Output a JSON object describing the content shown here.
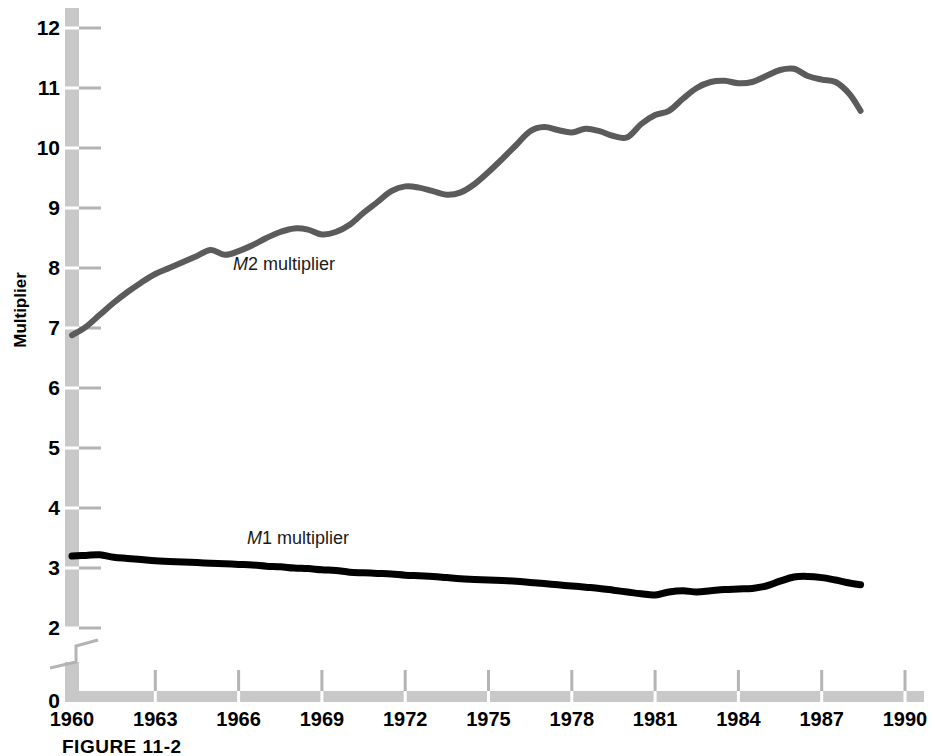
{
  "figure": {
    "caption": "FIGURE 11-2"
  },
  "chart_data": {
    "type": "line",
    "title": "",
    "xlabel": "",
    "ylabel": "Multiplier",
    "xlim": [
      1960,
      1990
    ],
    "ylim": [
      2,
      12.4
    ],
    "y_axis_break_below": 2,
    "y_zero_label": "0",
    "grid": false,
    "legend_position": "inline-annotation",
    "yticks": [
      2,
      3,
      4,
      5,
      6,
      7,
      8,
      9,
      10,
      11,
      12
    ],
    "ytick_labels": [
      "2",
      "3",
      "4",
      "5",
      "6",
      "7",
      "8",
      "9",
      "10",
      "11",
      "12"
    ],
    "xticks": [
      1960,
      1963,
      1966,
      1969,
      1972,
      1975,
      1978,
      1981,
      1984,
      1987,
      1990
    ],
    "xtick_labels": [
      "1960",
      "1963",
      "1966",
      "1969",
      "1972",
      "1975",
      "1978",
      "1981",
      "1984",
      "1987",
      "1990"
    ],
    "colors": {
      "m2_line": "#5b5b5b",
      "m1_line": "#000000",
      "axis_bar": "#c8c8c8",
      "tick_mark": "#b4b4b4"
    },
    "series": [
      {
        "name": "M2 multiplier",
        "label_html": "M2 multiplier",
        "color": "#5b5b5b",
        "width": 6,
        "x": [
          1960.0,
          1960.5,
          1961.0,
          1961.5,
          1962.0,
          1962.5,
          1963.0,
          1963.5,
          1964.0,
          1964.5,
          1965.0,
          1965.5,
          1966.0,
          1966.5,
          1967.0,
          1967.5,
          1968.0,
          1968.5,
          1969.0,
          1969.5,
          1970.0,
          1970.5,
          1971.0,
          1971.5,
          1972.0,
          1972.5,
          1973.0,
          1973.5,
          1974.0,
          1974.5,
          1975.0,
          1975.5,
          1976.0,
          1976.5,
          1977.0,
          1977.5,
          1978.0,
          1978.5,
          1979.0,
          1979.5,
          1980.0,
          1980.5,
          1981.0,
          1981.5,
          1982.0,
          1982.5,
          1983.0,
          1983.5,
          1984.0,
          1984.5,
          1985.0,
          1985.5,
          1986.0,
          1986.5,
          1987.0,
          1987.5,
          1988.0,
          1988.4
        ],
        "values": [
          6.88,
          7.02,
          7.22,
          7.42,
          7.6,
          7.76,
          7.9,
          8.0,
          8.1,
          8.2,
          8.3,
          8.22,
          8.28,
          8.38,
          8.5,
          8.6,
          8.66,
          8.64,
          8.56,
          8.6,
          8.72,
          8.92,
          9.1,
          9.28,
          9.36,
          9.34,
          9.28,
          9.22,
          9.26,
          9.4,
          9.6,
          9.82,
          10.05,
          10.28,
          10.35,
          10.3,
          10.26,
          10.32,
          10.28,
          10.2,
          10.18,
          10.4,
          10.55,
          10.62,
          10.82,
          11.0,
          11.1,
          11.12,
          11.08,
          11.1,
          11.2,
          11.3,
          11.32,
          11.2,
          11.14,
          11.1,
          10.9,
          10.62
        ],
        "start_value": 6.88,
        "peak_value": 11.32,
        "peak_year": 1986,
        "end_value": 10.62
      },
      {
        "name": "M1 multiplier",
        "label_html": "M1 multiplier",
        "color": "#000000",
        "width": 7,
        "x": [
          1960.0,
          1960.5,
          1961.0,
          1961.5,
          1962.0,
          1962.5,
          1963.0,
          1963.5,
          1964.0,
          1964.5,
          1965.0,
          1965.5,
          1966.0,
          1966.5,
          1967.0,
          1967.5,
          1968.0,
          1968.5,
          1969.0,
          1969.5,
          1970.0,
          1970.5,
          1971.0,
          1971.5,
          1972.0,
          1972.5,
          1973.0,
          1973.5,
          1974.0,
          1974.5,
          1975.0,
          1975.5,
          1976.0,
          1976.5,
          1977.0,
          1977.5,
          1978.0,
          1978.5,
          1979.0,
          1979.5,
          1980.0,
          1980.5,
          1981.0,
          1981.5,
          1982.0,
          1982.5,
          1983.0,
          1983.5,
          1984.0,
          1984.5,
          1985.0,
          1985.5,
          1986.0,
          1986.5,
          1987.0,
          1987.5,
          1988.0,
          1988.4
        ],
        "values": [
          3.2,
          3.21,
          3.22,
          3.18,
          3.16,
          3.14,
          3.12,
          3.11,
          3.1,
          3.09,
          3.08,
          3.07,
          3.06,
          3.05,
          3.03,
          3.02,
          3.0,
          2.99,
          2.97,
          2.96,
          2.93,
          2.92,
          2.91,
          2.9,
          2.88,
          2.87,
          2.86,
          2.84,
          2.82,
          2.81,
          2.8,
          2.79,
          2.78,
          2.76,
          2.74,
          2.72,
          2.7,
          2.68,
          2.66,
          2.63,
          2.6,
          2.57,
          2.55,
          2.6,
          2.62,
          2.6,
          2.62,
          2.64,
          2.65,
          2.66,
          2.7,
          2.78,
          2.85,
          2.86,
          2.84,
          2.8,
          2.75,
          2.72
        ],
        "start_value": 3.2,
        "min_value": 2.55,
        "min_year": 1981,
        "end_value": 2.72
      }
    ],
    "annotations": [
      {
        "name": "m2-label",
        "text": "M2 multiplier",
        "x": 1965.8,
        "y": 8.05
      },
      {
        "name": "m1-label",
        "text": "M1 multiplier",
        "x": 1966.3,
        "y": 3.48
      }
    ]
  }
}
